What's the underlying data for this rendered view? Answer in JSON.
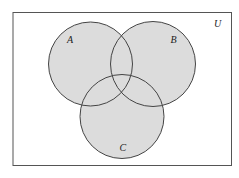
{
  "diagram": {
    "type": "venn",
    "universe": {
      "label": "U",
      "x": 13,
      "y": 12.5,
      "width": 218.5,
      "height": 153
    },
    "sets": [
      {
        "id": "A",
        "label": "A",
        "cx": 90.5,
        "cy": 64,
        "r": 42,
        "label_x": 70,
        "label_y": 43
      },
      {
        "id": "B",
        "label": "B",
        "cx": 153,
        "cy": 64,
        "r": 42.5,
        "label_x": 173.5,
        "label_y": 43
      },
      {
        "id": "C",
        "label": "C",
        "cx": 122,
        "cy": 116.5,
        "r": 42,
        "label_x": 122.5,
        "label_y": 151
      }
    ],
    "colors": {
      "fill": "#dcdcdc",
      "stroke": "#444444",
      "frame": "#555555",
      "text": "#222222"
    },
    "shaded_region": "A ∪ B ∪ C"
  }
}
